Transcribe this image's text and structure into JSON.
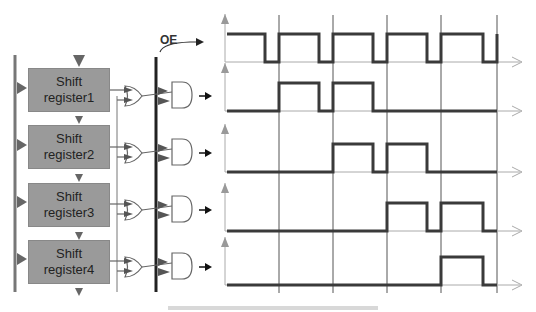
{
  "diagram": {
    "oe_label": "OE",
    "registers": [
      {
        "line1": "Shift",
        "line2": "register1"
      },
      {
        "line1": "Shift",
        "line2": "register2"
      },
      {
        "line1": "Shift",
        "line2": "register3"
      },
      {
        "line1": "Shift",
        "line2": "register4"
      }
    ],
    "waveforms": [
      {
        "name": "OE",
        "pattern": "clock"
      },
      {
        "name": "out1",
        "high_pulses": [
          1,
          2
        ]
      },
      {
        "name": "out2",
        "high_pulses": [
          2,
          3
        ]
      },
      {
        "name": "out3",
        "high_pulses": [
          3,
          4
        ]
      },
      {
        "name": "out4",
        "high_pulses": [
          4
        ]
      }
    ],
    "colors": {
      "register_fill": "#9a9a9a",
      "wave": "#3a3a3a",
      "grid": "#555555",
      "axis": "#9a9a9a"
    }
  }
}
